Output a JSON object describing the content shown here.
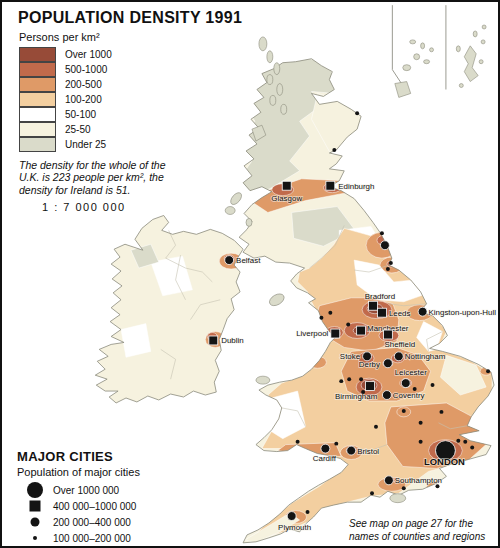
{
  "title": "POPULATION DENSITY 1991",
  "density_legend": {
    "unit": "Persons per km²",
    "classes": [
      {
        "label": "Over 1000",
        "color": "#974b38"
      },
      {
        "label": "500-1000",
        "color": "#c16a4b"
      },
      {
        "label": "200-500",
        "color": "#df9a67"
      },
      {
        "label": "100-200",
        "color": "#f3cfa0"
      },
      {
        "label": "50-100",
        "color": "#ffffff"
      },
      {
        "label": "25-50",
        "color": "#f6f2df"
      },
      {
        "label": "Under 25",
        "color": "#dadbca"
      }
    ]
  },
  "note_lines": [
    "The density for the whole of the",
    "U.K. is 223 people per km², the",
    "density for Ireland is 51."
  ],
  "scale_text": "1 : 7 000 000",
  "cities_legend": {
    "title": "MAJOR CITIES",
    "subtitle": "Population of major cities",
    "classes": [
      {
        "label": "Over 1000 000",
        "symbol": "circle-large"
      },
      {
        "label": "400 000–1000 000",
        "symbol": "square"
      },
      {
        "label": "200 000–400 000",
        "symbol": "circle-medium"
      },
      {
        "label": "100 000–200 000",
        "symbol": "dot"
      }
    ]
  },
  "footnote_lines": [
    "See map on page 27  for the",
    "names of counties and regions"
  ],
  "marker_color": "#141414",
  "map": {
    "cities": [
      {
        "name": "Glasgow",
        "x": 287,
        "y": 185,
        "marker": "square",
        "lx": 287,
        "ly": 200,
        "anchor": "middle"
      },
      {
        "name": "Edinburgh",
        "x": 331,
        "y": 185,
        "marker": "square",
        "lx": 339,
        "ly": 188,
        "anchor": "start"
      },
      {
        "name": "Belfast",
        "x": 229,
        "y": 260,
        "marker": "circle",
        "lx": 236,
        "ly": 263,
        "anchor": "start"
      },
      {
        "name": "Dublin",
        "x": 213,
        "y": 341,
        "marker": "square",
        "lx": 221,
        "ly": 344,
        "anchor": "start"
      },
      {
        "name": "Bradford",
        "x": 374,
        "y": 306,
        "marker": "square",
        "lx": 381,
        "ly": 299,
        "anchor": "middle"
      },
      {
        "name": "Leeds",
        "x": 383,
        "y": 313,
        "marker": "square",
        "lx": 390,
        "ly": 316,
        "anchor": "start"
      },
      {
        "name": "Kingston-upon-Hull",
        "x": 424,
        "y": 312,
        "marker": "circle",
        "lx": 430,
        "ly": 315,
        "anchor": "start"
      },
      {
        "name": "Liverpool",
        "x": 336,
        "y": 334,
        "marker": "square",
        "lx": 329,
        "ly": 337,
        "anchor": "end"
      },
      {
        "name": "Manchester",
        "x": 362,
        "y": 331,
        "marker": "square",
        "lx": 368,
        "ly": 331,
        "anchor": "start"
      },
      {
        "name": "Sheffield",
        "x": 389,
        "y": 335,
        "marker": "square",
        "lx": 401,
        "ly": 348,
        "anchor": "middle"
      },
      {
        "name": "Stoke",
        "x": 368,
        "y": 357,
        "marker": "circle",
        "lx": 361,
        "ly": 360,
        "anchor": "end"
      },
      {
        "name": "Nottingham",
        "x": 400,
        "y": 357,
        "marker": "circle",
        "lx": 406,
        "ly": 360,
        "anchor": "start"
      },
      {
        "name": "Derby",
        "x": 389,
        "y": 364,
        "marker": "circle",
        "lx": 381,
        "ly": 368,
        "anchor": "end"
      },
      {
        "name": "Leicester",
        "x": 407,
        "y": 384,
        "marker": "circle",
        "lx": 412,
        "ly": 376,
        "anchor": "middle"
      },
      {
        "name": "Birmingham",
        "x": 371,
        "y": 387,
        "marker": "square",
        "lx": 357,
        "ly": 400,
        "anchor": "middle"
      },
      {
        "name": "Coventry",
        "x": 388,
        "y": 396,
        "marker": "circle",
        "lx": 394,
        "ly": 399,
        "anchor": "start"
      },
      {
        "name": "Cardiff",
        "x": 326,
        "y": 450,
        "marker": "circle",
        "lx": 325,
        "ly": 463,
        "anchor": "middle"
      },
      {
        "name": "Bristol",
        "x": 352,
        "y": 452,
        "marker": "circle",
        "lx": 358,
        "ly": 455,
        "anchor": "start"
      },
      {
        "name": "LONDON",
        "x": 447,
        "y": 452,
        "marker": "circle-large",
        "lx": 446,
        "ly": 467,
        "anchor": "middle",
        "big": true
      },
      {
        "name": "Southampton",
        "x": 390,
        "y": 482,
        "marker": "circle",
        "lx": 396,
        "ly": 485,
        "anchor": "start"
      },
      {
        "name": "Plymouth",
        "x": 292,
        "y": 518,
        "marker": "circle",
        "lx": 295,
        "ly": 532,
        "anchor": "middle"
      }
    ],
    "unlabeled_cities": {
      "medium": [
        [
          386,
          245
        ]
      ],
      "small": [
        [
          358,
          112
        ],
        [
          335,
          149
        ],
        [
          383,
          233
        ],
        [
          392,
          263
        ],
        [
          389,
          269
        ],
        [
          331,
          313
        ],
        [
          322,
          318
        ],
        [
          349,
          325
        ],
        [
          490,
          372
        ],
        [
          434,
          386
        ],
        [
          416,
          390
        ],
        [
          405,
          412
        ],
        [
          443,
          413
        ],
        [
          422,
          424
        ],
        [
          377,
          428
        ],
        [
          342,
          382
        ],
        [
          298,
          443
        ],
        [
          337,
          445
        ],
        [
          422,
          443
        ],
        [
          460,
          442
        ],
        [
          467,
          443
        ],
        [
          474,
          449
        ],
        [
          405,
          490
        ],
        [
          439,
          488
        ],
        [
          373,
          495
        ],
        [
          308,
          514
        ],
        [
          362,
          380
        ],
        [
          364,
          393
        ],
        [
          350,
          380
        ]
      ]
    }
  }
}
